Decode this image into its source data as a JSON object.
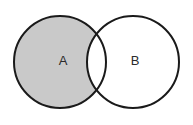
{
  "figure": {
    "name": "two-set-venn-diagram",
    "width": 193,
    "height": 125,
    "background_color": "#ffffff",
    "shaded_region_description": "A only (A minus B)"
  },
  "style": {
    "outline_color": "#1a1a1a",
    "outline_width": 2,
    "shaded_fill": "#c9c9c9",
    "unshaded_fill": "#ffffff",
    "label_color": "#2b2b2b"
  },
  "sets": [
    {
      "id": "A",
      "label": "A",
      "cx": 60,
      "cy": 62,
      "r": 46,
      "fill": "#c9c9c9",
      "label_x": 63,
      "label_y": 62
    },
    {
      "id": "B",
      "label": "B",
      "cx": 133,
      "cy": 62,
      "r": 46,
      "fill": "#ffffff",
      "label_x": 135,
      "label_y": 62
    }
  ],
  "regions": {
    "a_only": {
      "name": "a-only-region",
      "shaded": true,
      "fill": "#c9c9c9"
    },
    "intersection": {
      "name": "intersection-region",
      "shaded": false,
      "fill": "#ffffff"
    },
    "b_only": {
      "name": "b-only-region",
      "shaded": false,
      "fill": "#ffffff"
    }
  }
}
